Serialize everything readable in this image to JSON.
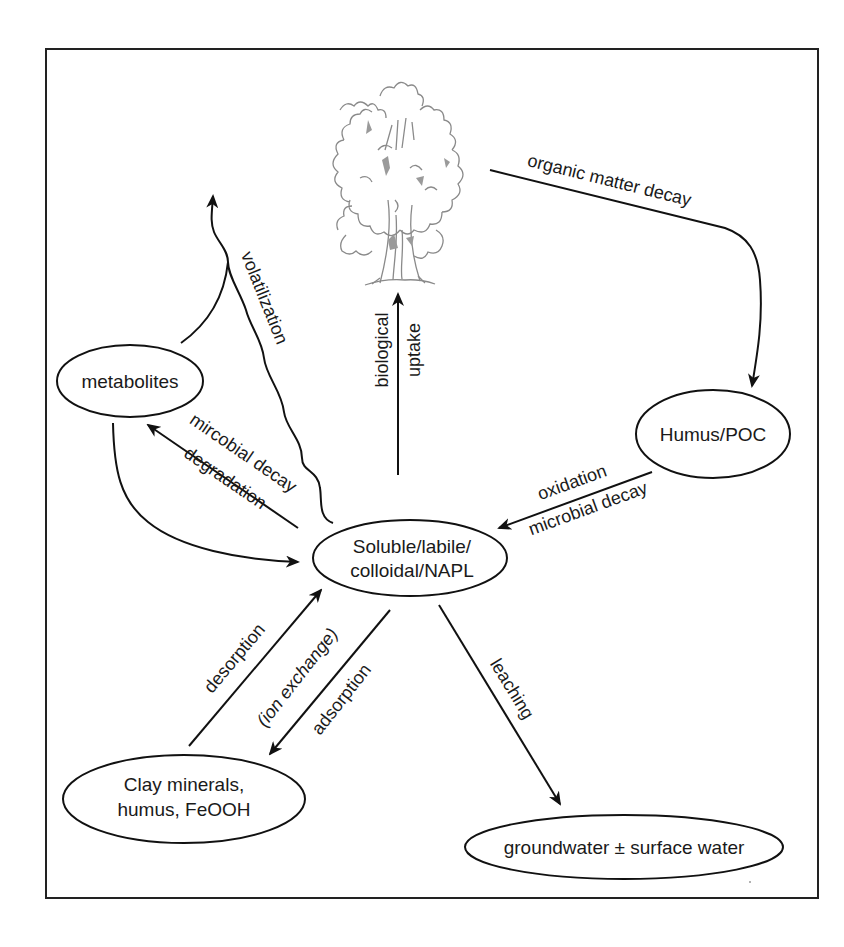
{
  "diagram": {
    "type": "process cycle",
    "nodes": {
      "tree": {
        "label": "",
        "icon": "tree-icon"
      },
      "metabolites": {
        "label": "metabolites"
      },
      "humus_poc": {
        "label": "Humus/POC"
      },
      "soluble": {
        "line1": "Soluble/labile/",
        "line2": "colloidal/NAPL"
      },
      "clay": {
        "line1": "Clay minerals,",
        "line2": "humus, FeOOH"
      },
      "groundwater": {
        "label": "groundwater ± surface water"
      }
    },
    "edges": {
      "organic_matter_decay": {
        "label": "organic matter decay",
        "from": "tree",
        "to": "humus_poc"
      },
      "oxidation": {
        "line1": "oxidation",
        "line2": "microbial decay",
        "from": "humus_poc",
        "to": "soluble"
      },
      "biological_uptake": {
        "line1": "biological",
        "line2": "uptake",
        "from": "soluble",
        "to": "tree"
      },
      "volatilization": {
        "label": "volatilization",
        "from": "soluble",
        "to": "atmosphere"
      },
      "microbial_degradation": {
        "line1": "mircobial decay",
        "line2": "degradation",
        "from": "soluble",
        "to": "metabolites"
      },
      "metabolites_return": {
        "label": "",
        "from": "metabolites",
        "to": "soluble"
      },
      "desorption": {
        "label": "desorption",
        "from": "clay",
        "to": "soluble"
      },
      "ion_exchange": {
        "label": "(ion exchange)"
      },
      "adsorption": {
        "label": "adsorption",
        "from": "soluble",
        "to": "clay"
      },
      "leaching": {
        "label": "leaching",
        "from": "soluble",
        "to": "groundwater"
      }
    },
    "colors": {
      "line": "#111111",
      "tree": "#8a8a8a",
      "background": "#ffffff"
    }
  }
}
